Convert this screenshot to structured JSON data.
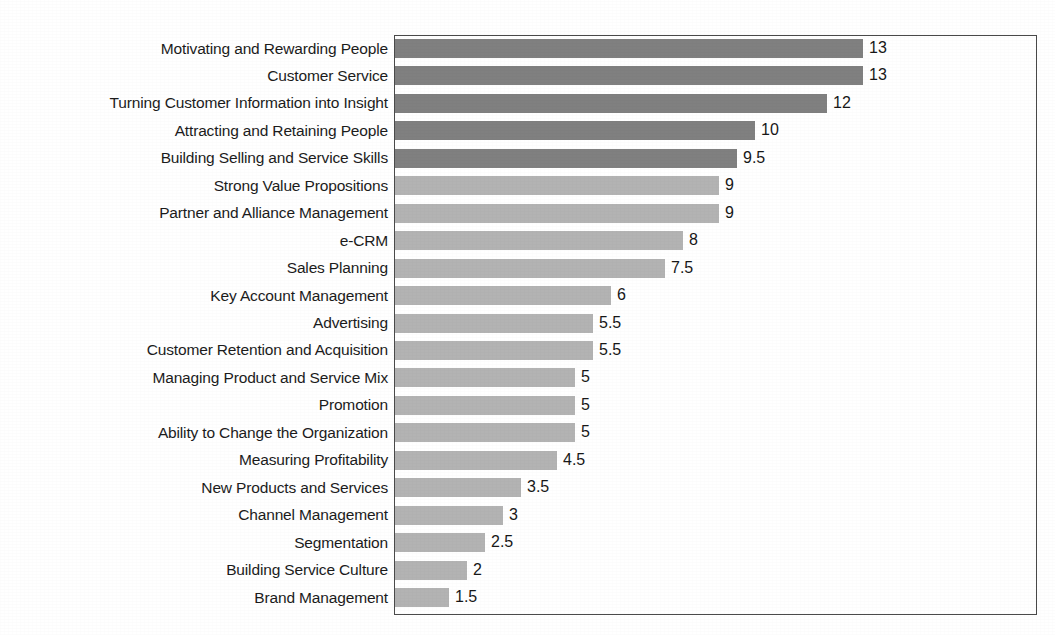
{
  "chart_data": {
    "type": "bar",
    "orientation": "horizontal",
    "title": "",
    "subtitle": "",
    "xlabel": "",
    "ylabel": "",
    "xlim": [
      0,
      17.9
    ],
    "grid": false,
    "legend": false,
    "axis_tick_labels": [],
    "data_labels_shown": true,
    "categories": [
      "Motivating and Rewarding People",
      "Customer Service",
      "Turning Customer Information into Insight",
      "Attracting and Retaining People",
      "Building Selling and Service Skills",
      "Strong Value Propositions",
      "Partner and Alliance Management",
      "e-CRM",
      "Sales Planning",
      "Key Account Management",
      "Advertising",
      "Customer Retention and Acquisition",
      "Managing Product and Service Mix",
      "Promotion",
      "Ability to Change the Organization",
      "Measuring Profitability",
      "New Products and Services",
      "Channel Management",
      "Segmentation",
      "Building Service Culture",
      "Brand Management"
    ],
    "values": [
      13,
      13,
      12,
      10,
      9.5,
      9,
      9,
      8,
      7.5,
      6,
      5.5,
      5.5,
      5,
      5,
      5,
      4.5,
      3.5,
      3,
      2.5,
      2,
      1.5
    ],
    "value_labels": [
      "13",
      "13",
      "12",
      "10",
      "9.5",
      "9",
      "9",
      "8",
      "7.5",
      "6",
      "5.5",
      "5.5",
      "5",
      "5",
      "5",
      "4.5",
      "3.5",
      "3",
      "2.5",
      "2",
      "1.5"
    ],
    "bar_colors": [
      "#808080",
      "#808080",
      "#808080",
      "#808080",
      "#808080",
      "#b3b3b3",
      "#b3b3b3",
      "#b3b3b3",
      "#b3b3b3",
      "#b3b3b3",
      "#b3b3b3",
      "#b3b3b3",
      "#b3b3b3",
      "#b3b3b3",
      "#b3b3b3",
      "#b3b3b3",
      "#b3b3b3",
      "#b3b3b3",
      "#b3b3b3",
      "#b3b3b3",
      "#b3b3b3"
    ],
    "colors": {
      "dark_bar": "#808080",
      "light_bar": "#b3b3b3",
      "frame": "#4a4a4a",
      "text": "#1a1a1a",
      "background": "#ffffff"
    }
  }
}
